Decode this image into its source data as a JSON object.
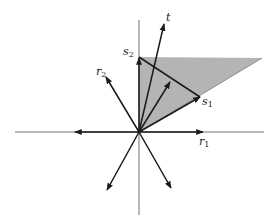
{
  "diagram": {
    "type": "vector-cone-diagram",
    "colors": {
      "background": "#ffffff",
      "shade": "#b4b4b4",
      "axis": "#707070",
      "vector": "#1a1a1a"
    },
    "origin": [
      139,
      132
    ],
    "labels": {
      "t": {
        "base": "t",
        "sub": ""
      },
      "s1": {
        "base": "s",
        "sub": "1"
      },
      "s2": {
        "base": "s",
        "sub": "2"
      },
      "r1": {
        "base": "r",
        "sub": "1"
      },
      "r2": {
        "base": "r",
        "sub": "2"
      }
    },
    "shaded_region": {
      "description": "triangular cone between s2 direction (vertical) and s1 direction",
      "vertices": [
        [
          139,
          132
        ],
        [
          139,
          57
        ],
        [
          262,
          58
        ]
      ]
    },
    "vectors": [
      {
        "name": "t",
        "tip": [
          164,
          24
        ]
      },
      {
        "name": "s1",
        "tip": [
          200,
          97
        ]
      },
      {
        "name": "s2",
        "tip": [
          139,
          57
        ]
      },
      {
        "name": "r1",
        "tip": [
          203,
          132
        ]
      },
      {
        "name": "r2",
        "tip": [
          106,
          77
        ]
      },
      {
        "name": "midpoint-vector",
        "tip": [
          170,
          82
        ]
      },
      {
        "name": "negative-r1",
        "tip": [
          75,
          132
        ]
      },
      {
        "name": "lower-left",
        "tip": [
          107,
          190
        ]
      },
      {
        "name": "lower-right",
        "tip": [
          171,
          188
        ]
      }
    ],
    "segment_s1_s2": {
      "from": [
        139,
        57
      ],
      "to": [
        200,
        97
      ]
    }
  }
}
